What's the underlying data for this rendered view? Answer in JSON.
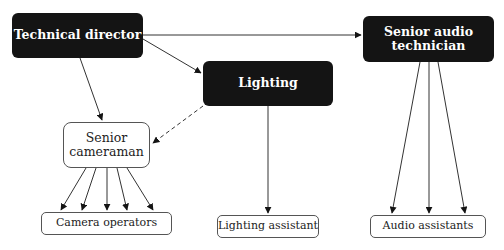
{
  "diagram": {
    "type": "organization-chart",
    "nodes": {
      "technical_director": {
        "label": "Technical director",
        "style": "dark"
      },
      "lighting": {
        "label": "Lighting",
        "style": "dark"
      },
      "senior_audio_technician": {
        "label": "Senior audio technician",
        "line1": "Senior audio",
        "line2": "technician",
        "style": "dark"
      },
      "senior_cameraman": {
        "label": "Senior cameraman",
        "line1": "Senior",
        "line2": "cameraman",
        "style": "light"
      },
      "camera_operators": {
        "label": "Camera operators",
        "style": "light"
      },
      "lighting_assistant": {
        "label": "Lighting assistant",
        "style": "light"
      },
      "audio_assistants": {
        "label": "Audio assistants",
        "style": "light"
      }
    },
    "edges": [
      {
        "from": "technical_director",
        "to": "senior_audio_technician",
        "style": "solid"
      },
      {
        "from": "technical_director",
        "to": "lighting",
        "style": "solid"
      },
      {
        "from": "technical_director",
        "to": "senior_cameraman",
        "style": "solid"
      },
      {
        "from": "lighting",
        "to": "senior_cameraman",
        "style": "dashed"
      },
      {
        "from": "lighting",
        "to": "lighting_assistant",
        "style": "solid"
      },
      {
        "from": "senior_cameraman",
        "to": "camera_operators",
        "style": "solid",
        "count": 5
      },
      {
        "from": "senior_audio_technician",
        "to": "audio_assistants",
        "style": "solid",
        "count": 3
      }
    ],
    "colors": {
      "dark_fill": "#141414",
      "dark_text": "#ffffff",
      "line": "#333333",
      "light_border": "#555555"
    }
  }
}
